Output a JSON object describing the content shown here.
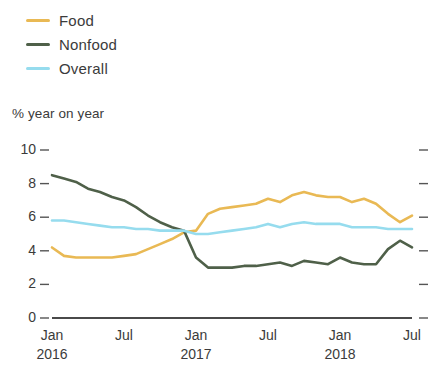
{
  "chart_data": {
    "type": "line",
    "title": "",
    "subtitle": "% year on year",
    "xlabel": "",
    "ylabel": "% year on year",
    "ylim": [
      0,
      10
    ],
    "yticks": [
      0,
      2,
      4,
      6,
      8,
      10
    ],
    "grid": false,
    "legend_position": "top-left",
    "x_tick_labels": [
      "Jan",
      "Jul",
      "Jan",
      "Jul",
      "Jan",
      "Jul"
    ],
    "x_tick_years": [
      "2016",
      "",
      "2017",
      "",
      "2018",
      ""
    ],
    "x_tick_index": [
      0,
      6,
      12,
      18,
      24,
      30
    ],
    "x": [
      "2016-01",
      "2016-02",
      "2016-03",
      "2016-04",
      "2016-05",
      "2016-06",
      "2016-07",
      "2016-08",
      "2016-09",
      "2016-10",
      "2016-11",
      "2016-12",
      "2017-01",
      "2017-02",
      "2017-03",
      "2017-04",
      "2017-05",
      "2017-06",
      "2017-07",
      "2017-08",
      "2017-09",
      "2017-10",
      "2017-11",
      "2017-12",
      "2018-01",
      "2018-02",
      "2018-03",
      "2018-04",
      "2018-05",
      "2018-06",
      "2018-07"
    ],
    "series": [
      {
        "name": "Food",
        "color": "#E9B954",
        "values": [
          4.2,
          3.7,
          3.6,
          3.6,
          3.6,
          3.6,
          3.7,
          3.8,
          4.1,
          4.4,
          4.7,
          5.1,
          5.2,
          6.2,
          6.5,
          6.6,
          6.7,
          6.8,
          7.1,
          6.9,
          7.3,
          7.5,
          7.3,
          7.2,
          7.2,
          6.9,
          7.1,
          6.8,
          6.2,
          5.7,
          6.1
        ]
      },
      {
        "name": "Nonfood",
        "color": "#4F6049",
        "values": [
          8.5,
          8.3,
          8.1,
          7.7,
          7.5,
          7.2,
          7.0,
          6.6,
          6.1,
          5.7,
          5.4,
          5.2,
          3.6,
          3.0,
          3.0,
          3.0,
          3.1,
          3.1,
          3.2,
          3.3,
          3.1,
          3.4,
          3.3,
          3.2,
          3.6,
          3.3,
          3.2,
          3.2,
          4.1,
          4.6,
          4.2
        ]
      },
      {
        "name": "Overall",
        "color": "#96DCEE",
        "values": [
          5.8,
          5.8,
          5.7,
          5.6,
          5.5,
          5.4,
          5.4,
          5.3,
          5.3,
          5.2,
          5.2,
          5.2,
          5.0,
          5.0,
          5.1,
          5.2,
          5.3,
          5.4,
          5.6,
          5.4,
          5.6,
          5.7,
          5.6,
          5.6,
          5.6,
          5.4,
          5.4,
          5.4,
          5.3,
          5.3,
          5.3
        ]
      }
    ]
  },
  "legend": {
    "items": [
      {
        "label": "Food",
        "color": "#E9B954"
      },
      {
        "label": "Nonfood",
        "color": "#4F6049"
      },
      {
        "label": "Overall",
        "color": "#96DCEE"
      }
    ]
  },
  "axis": {
    "subtitle": "% year on year",
    "y_labels": [
      "10",
      "8",
      "6",
      "4",
      "2",
      "0"
    ],
    "x_labels": [
      "Jan",
      "Jul",
      "Jan",
      "Jul",
      "Jan",
      "Jul"
    ],
    "x_years": [
      "2016",
      "2017",
      "2018"
    ]
  }
}
